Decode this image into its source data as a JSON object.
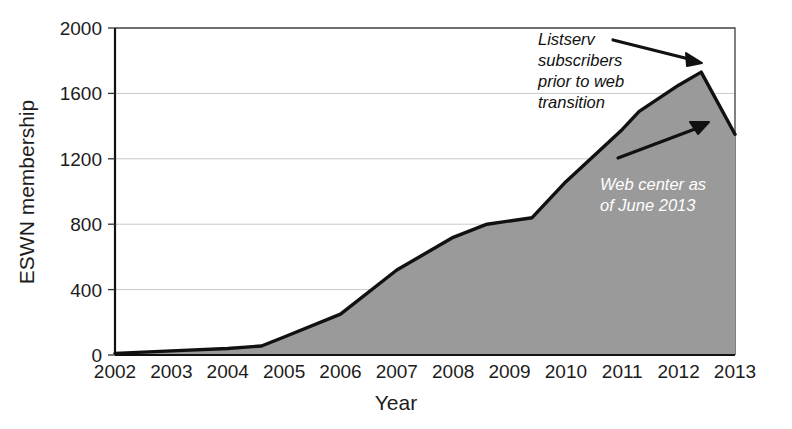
{
  "chart_data": {
    "type": "area",
    "title": "",
    "xlabel": "Year",
    "ylabel": "ESWN membership",
    "xlim": [
      2002,
      2013
    ],
    "ylim": [
      0,
      2000
    ],
    "grid": true,
    "legend": "none",
    "fill_color": "#9a9a9a",
    "line_color": "#111111",
    "x_tick_labels": [
      "2002",
      "2003",
      "2004",
      "2005",
      "2006",
      "2007",
      "2008",
      "2009",
      "2010",
      "2011",
      "2012",
      "2013"
    ],
    "y_tick_labels": [
      "0",
      "400",
      "800",
      "1200",
      "1600",
      "2000"
    ],
    "y_ticks": [
      0,
      400,
      800,
      1200,
      1600,
      2000
    ],
    "x": [
      2002,
      2003,
      2004,
      2004.6,
      2005,
      2006,
      2007,
      2008,
      2008.6,
      2009.4,
      2010,
      2011,
      2011.3,
      2012,
      2012.4,
      2013
    ],
    "values": [
      10,
      25,
      40,
      55,
      110,
      250,
      520,
      720,
      800,
      840,
      1060,
      1380,
      1490,
      1650,
      1730,
      1350
    ],
    "annotations": [
      {
        "id": "listserv-note",
        "text_lines": [
          "Listserv",
          "subscribers",
          "prior to web",
          "transition"
        ],
        "style": "italic-dark",
        "arrow_from": [
          613,
          40
        ],
        "arrow_to": [
          702,
          63
        ]
      },
      {
        "id": "web-center-note",
        "text_lines": [
          "Web center as",
          "of June 2013"
        ],
        "style": "italic-light",
        "arrow_from": [
          618,
          158
        ],
        "arrow_to": [
          709,
          122
        ]
      }
    ]
  },
  "geometry": {
    "plot_left": 115,
    "plot_right": 735,
    "plot_top": 28,
    "plot_bottom": 355
  }
}
